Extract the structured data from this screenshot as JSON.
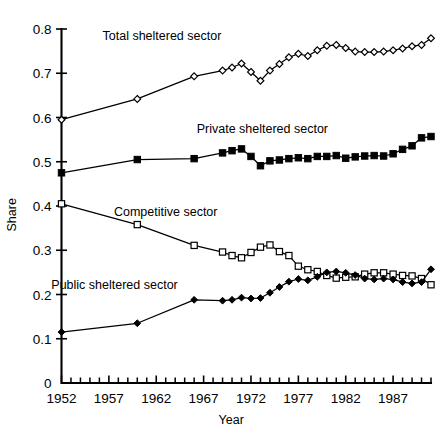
{
  "chart_data": {
    "type": "line",
    "title": "",
    "xlabel": "Year",
    "ylabel": "Share",
    "xlim": [
      1952,
      1991
    ],
    "ylim": [
      0,
      0.8
    ],
    "grid": false,
    "legend": "inline-annotations",
    "y_ticks": [
      "0",
      "0.1",
      "0.2",
      "0.3",
      "0.4",
      "0.5",
      "0.6",
      "0.7",
      "0.8"
    ],
    "y_tick_values": [
      0,
      0.1,
      0.2,
      0.3,
      0.4,
      0.5,
      0.6,
      0.7,
      0.8
    ],
    "x_ticks": [
      "1952",
      "1957",
      "1962",
      "1967",
      "1972",
      "1977",
      "1982",
      "1987"
    ],
    "x_tick_values": [
      1952,
      1957,
      1962,
      1967,
      1972,
      1977,
      1982,
      1987
    ],
    "x_minor_tick_values": [
      1953,
      1954,
      1955,
      1956,
      1958,
      1959,
      1960,
      1961,
      1963,
      1964,
      1965,
      1966,
      1968,
      1969,
      1970,
      1971,
      1973,
      1974,
      1975,
      1976,
      1978,
      1979,
      1980,
      1981,
      1983,
      1984,
      1985,
      1986,
      1988,
      1989,
      1990,
      1991
    ],
    "series": [
      {
        "name": "Total sheltered sector",
        "marker": "open-diamond",
        "label_x": 1962.6,
        "label_y": 0.775,
        "x": [
          1952,
          1960,
          1966,
          1969,
          1970,
          1971,
          1972,
          1973,
          1974,
          1975,
          1976,
          1977,
          1978,
          1979,
          1980,
          1981,
          1982,
          1983,
          1984,
          1985,
          1986,
          1987,
          1988,
          1989,
          1990,
          1991
        ],
        "values": [
          0.595,
          0.642,
          0.693,
          0.706,
          0.713,
          0.722,
          0.703,
          0.683,
          0.706,
          0.721,
          0.736,
          0.744,
          0.739,
          0.752,
          0.762,
          0.764,
          0.757,
          0.749,
          0.748,
          0.748,
          0.749,
          0.752,
          0.756,
          0.761,
          0.764,
          0.779
        ]
      },
      {
        "name": "Private sheltered sector",
        "marker": "filled-square",
        "label_x": 1973.2,
        "label_y": 0.565,
        "x": [
          1952,
          1960,
          1966,
          1969,
          1970,
          1971,
          1972,
          1973,
          1974,
          1975,
          1976,
          1977,
          1978,
          1979,
          1980,
          1981,
          1982,
          1983,
          1984,
          1985,
          1986,
          1987,
          1988,
          1989,
          1990,
          1991
        ],
        "values": [
          0.475,
          0.505,
          0.507,
          0.52,
          0.525,
          0.529,
          0.512,
          0.491,
          0.502,
          0.504,
          0.507,
          0.509,
          0.507,
          0.512,
          0.512,
          0.514,
          0.508,
          0.511,
          0.513,
          0.514,
          0.513,
          0.518,
          0.528,
          0.536,
          0.554,
          0.557
        ]
      },
      {
        "name": "Competitive sector",
        "marker": "open-square",
        "label_x": 1963.0,
        "label_y": 0.378,
        "x": [
          1952,
          1960,
          1966,
          1969,
          1970,
          1971,
          1972,
          1973,
          1974,
          1975,
          1976,
          1977,
          1978,
          1979,
          1980,
          1981,
          1982,
          1983,
          1984,
          1985,
          1986,
          1987,
          1988,
          1989,
          1990,
          1991
        ],
        "values": [
          0.405,
          0.358,
          0.311,
          0.296,
          0.288,
          0.283,
          0.295,
          0.307,
          0.312,
          0.297,
          0.288,
          0.264,
          0.256,
          0.252,
          0.243,
          0.237,
          0.239,
          0.24,
          0.246,
          0.249,
          0.249,
          0.246,
          0.243,
          0.242,
          0.236,
          0.222
        ]
      },
      {
        "name": "Public sheltered sector",
        "marker": "filled-diamond",
        "label_x": 1957.6,
        "label_y": 0.212,
        "x": [
          1952,
          1960,
          1966,
          1969,
          1970,
          1971,
          1972,
          1973,
          1974,
          1975,
          1976,
          1977,
          1978,
          1979,
          1980,
          1981,
          1982,
          1983,
          1984,
          1985,
          1986,
          1987,
          1988,
          1989,
          1990,
          1991
        ],
        "values": [
          0.115,
          0.135,
          0.188,
          0.186,
          0.188,
          0.193,
          0.191,
          0.192,
          0.204,
          0.217,
          0.229,
          0.235,
          0.232,
          0.24,
          0.25,
          0.252,
          0.249,
          0.244,
          0.236,
          0.234,
          0.236,
          0.234,
          0.228,
          0.225,
          0.228,
          0.257
        ]
      }
    ]
  }
}
